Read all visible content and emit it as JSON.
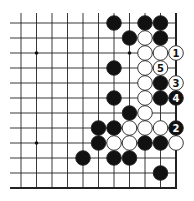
{
  "diagram": {
    "type": "go-board-fragment",
    "columns": 11,
    "rows": 12,
    "edges": {
      "right": true,
      "bottom": true,
      "left": false,
      "top": false
    },
    "grid": {
      "x0": 21,
      "y0": 23,
      "dx": 15.5,
      "dy": 15.0,
      "line_color": "#222222",
      "left_extent": 10,
      "top_extent": 13
    },
    "star_points": [
      {
        "col": 1,
        "row": 2
      },
      {
        "col": 7,
        "row": 2
      },
      {
        "col": 1,
        "row": 8
      }
    ],
    "stones": [
      {
        "col": 6,
        "row": 0,
        "color": "black"
      },
      {
        "col": 8,
        "row": 0,
        "color": "black"
      },
      {
        "col": 9,
        "row": 0,
        "color": "black"
      },
      {
        "col": 7,
        "row": 1,
        "color": "black"
      },
      {
        "col": 8,
        "row": 1,
        "color": "white"
      },
      {
        "col": 9,
        "row": 1,
        "color": "black"
      },
      {
        "col": 8,
        "row": 2,
        "color": "white"
      },
      {
        "col": 9,
        "row": 2,
        "color": "white"
      },
      {
        "col": 10,
        "row": 2,
        "color": "white",
        "label": "1"
      },
      {
        "col": 6,
        "row": 3,
        "color": "black"
      },
      {
        "col": 8,
        "row": 3,
        "color": "white"
      },
      {
        "col": 9,
        "row": 3,
        "color": "white",
        "label": "5"
      },
      {
        "col": 8,
        "row": 4,
        "color": "white"
      },
      {
        "col": 9,
        "row": 4,
        "color": "black"
      },
      {
        "col": 10,
        "row": 4,
        "color": "white",
        "label": "3"
      },
      {
        "col": 6,
        "row": 5,
        "color": "black"
      },
      {
        "col": 8,
        "row": 5,
        "color": "white"
      },
      {
        "col": 9,
        "row": 5,
        "color": "black"
      },
      {
        "col": 10,
        "row": 5,
        "color": "black",
        "label": "4"
      },
      {
        "col": 7,
        "row": 6,
        "color": "black"
      },
      {
        "col": 8,
        "row": 6,
        "color": "white"
      },
      {
        "col": 5,
        "row": 7,
        "color": "black"
      },
      {
        "col": 6,
        "row": 7,
        "color": "black"
      },
      {
        "col": 7,
        "row": 7,
        "color": "white"
      },
      {
        "col": 8,
        "row": 7,
        "color": "white"
      },
      {
        "col": 9,
        "row": 7,
        "color": "white"
      },
      {
        "col": 10,
        "row": 7,
        "color": "black",
        "label": "2"
      },
      {
        "col": 5,
        "row": 8,
        "color": "black"
      },
      {
        "col": 6,
        "row": 8,
        "color": "white"
      },
      {
        "col": 7,
        "row": 8,
        "color": "white"
      },
      {
        "col": 8,
        "row": 8,
        "color": "black"
      },
      {
        "col": 9,
        "row": 8,
        "color": "black"
      },
      {
        "col": 10,
        "row": 8,
        "color": "white"
      },
      {
        "col": 4,
        "row": 9,
        "color": "black"
      },
      {
        "col": 6,
        "row": 9,
        "color": "black"
      },
      {
        "col": 7,
        "row": 9,
        "color": "black"
      },
      {
        "col": 9,
        "row": 10,
        "color": "black"
      }
    ],
    "move_labels": [
      "1",
      "2",
      "3",
      "4",
      "5"
    ],
    "colors": {
      "black_stone": "#111111",
      "white_stone": "#ffffff",
      "stone_outline": "#222222"
    }
  }
}
